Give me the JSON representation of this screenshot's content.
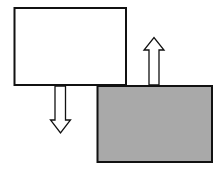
{
  "diagram": {
    "colors": {
      "stroke": "#111111",
      "white_fill": "#ffffff",
      "gray_fill": "#a9a9a9",
      "arrow_fill": "#ffffff"
    },
    "boxes": [
      {
        "name": "white-box",
        "x": 14,
        "y": 7,
        "width": 112,
        "height": 78
      },
      {
        "name": "gray-box",
        "x": 97,
        "y": 86,
        "width": 115,
        "height": 76
      }
    ],
    "arrows": [
      {
        "name": "down-arrow",
        "direction": "down"
      },
      {
        "name": "up-arrow",
        "direction": "up"
      }
    ]
  }
}
